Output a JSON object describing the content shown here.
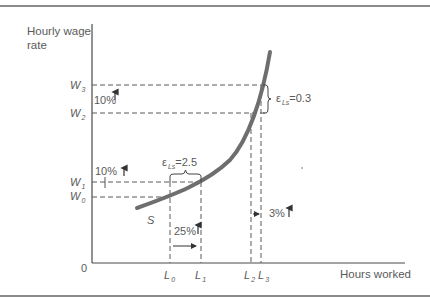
{
  "figure": {
    "y_axis_label_line1": "Hourly wage",
    "y_axis_label_line2": "rate",
    "x_axis_label": "Hours worked",
    "origin": "0",
    "curve_label": "S",
    "wage_levels": [
      {
        "base": "W",
        "sub": "3"
      },
      {
        "base": "W",
        "sub": "2"
      },
      {
        "base": "W",
        "sub": "1"
      },
      {
        "base": "W",
        "sub": "0"
      }
    ],
    "labor_levels": [
      {
        "base": "L",
        "sub": "0"
      },
      {
        "base": "L",
        "sub": "1"
      },
      {
        "base": "L",
        "sub": "2"
      },
      {
        "base": "L",
        "sub": "3"
      }
    ],
    "annotations": {
      "upper_wage_change": "10%",
      "lower_wage_change": "10%",
      "lower_labor_change": "25%",
      "upper_labor_change": "3%",
      "elasticity_low_symbol": "ε",
      "elasticity_low_sub": "Ls",
      "elasticity_low_value": "=2.5",
      "elasticity_high_symbol": "ε",
      "elasticity_high_sub": "Ls",
      "elasticity_high_value": "=0.3"
    },
    "colors": {
      "curve": "#6e6e6e",
      "axis": "#4a4a4a",
      "dashed": "#5a5a5a",
      "text": "#5a5a5a",
      "frame": "#8a8a8a"
    }
  }
}
